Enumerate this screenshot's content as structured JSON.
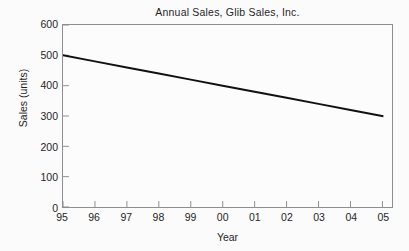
{
  "chart_data": {
    "type": "line",
    "title": "Annual Sales, Glib Sales, Inc.",
    "xlabel": "Year",
    "ylabel": "Sales (units)",
    "x": [
      "95",
      "96",
      "97",
      "98",
      "99",
      "00",
      "01",
      "02",
      "03",
      "04",
      "05"
    ],
    "categories": [
      "95",
      "96",
      "97",
      "98",
      "99",
      "00",
      "01",
      "02",
      "03",
      "04",
      "05"
    ],
    "values": [
      500,
      480,
      460,
      440,
      420,
      400,
      380,
      360,
      340,
      320,
      300
    ],
    "series": [
      {
        "name": "Annual Sales",
        "values": [
          500,
          480,
          460,
          440,
          420,
          400,
          380,
          360,
          340,
          320,
          300
        ]
      }
    ],
    "xlim": [
      0,
      10.3
    ],
    "ylim": [
      0,
      600
    ],
    "yticks": [
      0,
      100,
      200,
      300,
      400,
      500,
      600
    ],
    "ytick_labels": [
      "0",
      "100",
      "200",
      "300",
      "400",
      "500",
      "600"
    ],
    "xtick_labels": [
      "95",
      "96",
      "97",
      "98",
      "99",
      "00",
      "01",
      "02",
      "03",
      "04",
      "05"
    ],
    "grid": false,
    "legend": false,
    "legend_position": "none",
    "line_color": "#111111",
    "line_width": 2,
    "plot_border_color": "#8e8e90",
    "background_color": "#fbfbfb",
    "annotations": []
  },
  "figure": {
    "title": "Annual Sales, Glib Sales, Inc.",
    "x_axis_title": "Year",
    "y_axis_title": "Sales (units)"
  }
}
